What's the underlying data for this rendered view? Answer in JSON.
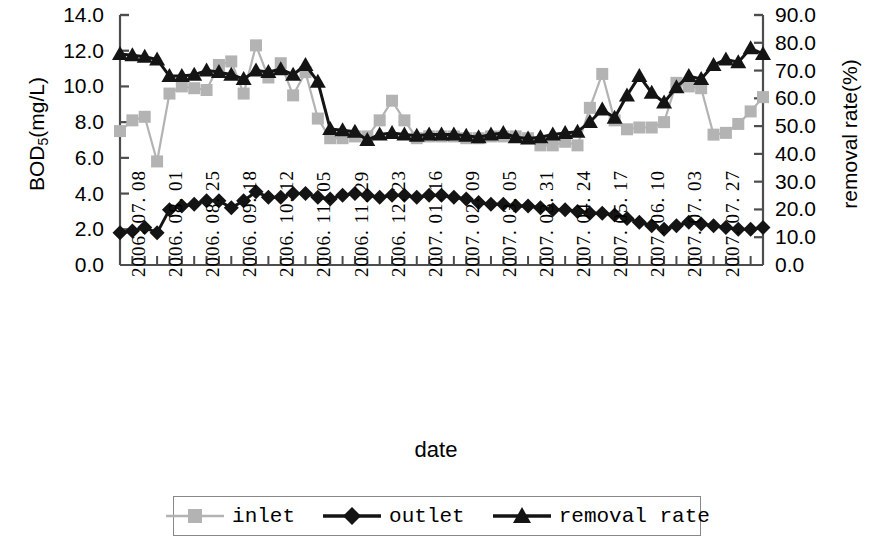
{
  "chart_data": {
    "type": "line",
    "title": "",
    "xlabel": "date",
    "ylabel": "BOD5(mg/L)",
    "y2label": "removal rate(%)",
    "ylim": [
      0.0,
      14.0
    ],
    "y2lim": [
      0.0,
      90.0
    ],
    "grid": false,
    "legend_position": "bottom",
    "y_ticks": [
      "0.0",
      "2.0",
      "4.0",
      "6.0",
      "8.0",
      "10.0",
      "12.0",
      "14.0"
    ],
    "y2_ticks": [
      "0.0",
      "10.0",
      "20.0",
      "30.0",
      "40.0",
      "50.0",
      "60.0",
      "70.0",
      "80.0",
      "90.0"
    ],
    "x_tick_labels": [
      "2006. 07. 08",
      "2006. 08. 01",
      "2006. 08. 25",
      "2006. 09. 18",
      "2006. 10. 12",
      "2006. 11. 05",
      "2006. 11. 29",
      "2006. 12. 23",
      "2007. 01. 16",
      "2007. 02. 09",
      "2007. 03. 05",
      "2007. 03. 31",
      "2007. 04. 24",
      "2007. 05. 17",
      "2007. 06. 10",
      "2007. 07. 03",
      "2007. 07. 27"
    ],
    "x_tick_indices": [
      0,
      3,
      6,
      9,
      12,
      15,
      18,
      21,
      24,
      27,
      30,
      33,
      36,
      39,
      42,
      45,
      48
    ],
    "n_points": 53,
    "series": [
      {
        "name": "inlet",
        "axis": "left",
        "color": "#b3b3b3",
        "marker": "square",
        "values": [
          7.5,
          8.1,
          8.3,
          5.8,
          9.6,
          10.0,
          9.9,
          9.8,
          11.2,
          11.4,
          9.6,
          12.3,
          10.5,
          11.3,
          9.5,
          10.8,
          8.2,
          7.1,
          7.1,
          7.2,
          7.2,
          8.1,
          9.2,
          8.1,
          7.1,
          7.2,
          7.2,
          7.2,
          7.1,
          7.1,
          7.2,
          7.2,
          7.2,
          7.1,
          6.7,
          6.7,
          6.9,
          6.7,
          8.8,
          10.7,
          8.1,
          7.6,
          7.7,
          7.7,
          8.0,
          10.2,
          10.0,
          9.9,
          7.3,
          7.4,
          7.9,
          8.6,
          9.4
        ]
      },
      {
        "name": "outlet",
        "axis": "left",
        "color": "#141414",
        "marker": "diamond",
        "values": [
          1.8,
          1.9,
          2.1,
          1.8,
          3.1,
          3.3,
          3.4,
          3.6,
          3.6,
          3.2,
          3.6,
          4.1,
          3.8,
          3.8,
          4.0,
          4.0,
          3.8,
          3.7,
          3.9,
          4.0,
          3.9,
          3.8,
          3.9,
          3.9,
          3.8,
          3.9,
          3.9,
          3.8,
          3.7,
          3.5,
          3.4,
          3.4,
          3.3,
          3.3,
          3.2,
          3.1,
          3.1,
          3.0,
          2.9,
          2.9,
          2.8,
          2.6,
          2.4,
          2.2,
          2.0,
          2.2,
          2.4,
          2.3,
          2.2,
          2.1,
          2.0,
          2.0,
          2.1
        ]
      },
      {
        "name": "removal rate",
        "axis": "right",
        "color": "#141414",
        "marker": "triangle",
        "values": [
          76.0,
          75.5,
          75.0,
          74.0,
          68.0,
          68.0,
          68.5,
          70.0,
          69.5,
          68.5,
          67.0,
          70.0,
          69.5,
          70.5,
          68.5,
          72.0,
          66.0,
          49.0,
          48.5,
          48.0,
          45.0,
          47.0,
          47.5,
          47.0,
          46.5,
          47.0,
          47.0,
          47.0,
          46.5,
          46.0,
          47.0,
          47.5,
          46.0,
          45.5,
          46.0,
          47.0,
          47.5,
          48.0,
          51.5,
          56.0,
          53.0,
          61.0,
          68.0,
          62.0,
          58.5,
          64.0,
          68.0,
          67.0,
          72.0,
          74.0,
          73.0,
          78.0,
          76.0
        ]
      }
    ]
  },
  "legend": {
    "items": [
      {
        "label": "inlet",
        "marker": "square-marker",
        "color": "#b3b3b3"
      },
      {
        "label": "outlet",
        "marker": "diamond-marker",
        "color": "#141414"
      },
      {
        "label": "removal rate",
        "marker": "triangle-marker",
        "color": "#141414"
      }
    ]
  },
  "axes": {
    "left_title": "BOD",
    "left_title_sub": "5",
    "left_title_rest": "(mg/L)",
    "right_title": "removal rate(%)",
    "x_title": "date"
  }
}
